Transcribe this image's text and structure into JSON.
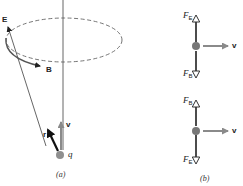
{
  "figure": {
    "panel_a": {
      "caption": "(a)",
      "labels": {
        "E": "E",
        "B": "B",
        "r": "r",
        "v": "v",
        "q": "q"
      },
      "elements": [
        "dashed circular orbit (ellipse in perspective)",
        "vertical axis line",
        "E field vector",
        "B field vector tangent to orbit",
        "r vector (thick black arrow)",
        "v velocity vector (gray, upward)",
        "charge q (gray dot)"
      ]
    },
    "panel_b": {
      "caption": "(b)",
      "top": {
        "up_force": "F",
        "up_force_sub": "E",
        "down_force": "F",
        "down_force_sub": "B",
        "velocity": "v"
      },
      "bottom": {
        "up_force": "F",
        "up_force_sub": "B",
        "down_force": "F",
        "down_force_sub": "E",
        "velocity": "v"
      }
    },
    "colors": {
      "line": "#555555",
      "dark_arrow": "#111111",
      "gray_arrow": "#8a8a8a",
      "charge": "#8f8f8f"
    }
  }
}
